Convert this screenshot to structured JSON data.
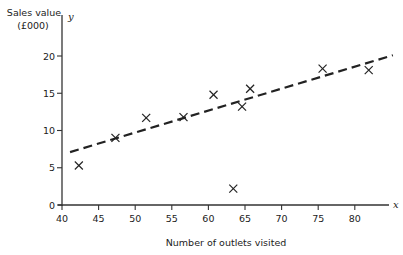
{
  "chart_data": {
    "type": "scatter",
    "title": "",
    "xlabel": "Number of outlets visited",
    "ylabel": "Sales value",
    "ylabel_unit": "(£000)",
    "x_axis_symbol": "x",
    "y_axis_symbol": "y",
    "xlim": [
      40,
      85
    ],
    "ylim": [
      0,
      22
    ],
    "x_ticks": [
      40,
      45,
      50,
      55,
      60,
      65,
      70,
      75,
      80
    ],
    "y_ticks": [
      0,
      5,
      10,
      15,
      20
    ],
    "grid": false,
    "legend": null,
    "marker": "x",
    "points": [
      {
        "x": 42.3,
        "y": 5.3
      },
      {
        "x": 47.3,
        "y": 9.0
      },
      {
        "x": 51.5,
        "y": 11.7
      },
      {
        "x": 56.6,
        "y": 11.8
      },
      {
        "x": 60.7,
        "y": 14.8
      },
      {
        "x": 63.4,
        "y": 2.2
      },
      {
        "x": 64.6,
        "y": 13.2
      },
      {
        "x": 65.7,
        "y": 15.6
      },
      {
        "x": 75.6,
        "y": 18.3
      },
      {
        "x": 81.9,
        "y": 18.1
      }
    ],
    "regression_line": {
      "style": "dashed",
      "start": {
        "x": 41.1,
        "y": 7.1
      },
      "end": {
        "x": 85.2,
        "y": 20.1
      }
    }
  },
  "labels": {
    "ylabel_line1": "Sales value",
    "ylabel_line2": "(£000)",
    "xlabel": "Number of outlets visited",
    "x_symbol": "x",
    "y_symbol": "y"
  }
}
